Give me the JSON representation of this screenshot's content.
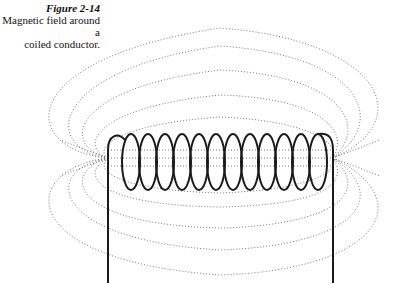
{
  "page": {
    "cut_text": "r ... y ... g ... p ... y"
  },
  "figure": {
    "label": "Figure 2-14",
    "caption_line1": "Magnetic field around a",
    "caption_line2": "coiled conductor.",
    "coil_turns": 13,
    "colors": {
      "wire": "#1a1a1a",
      "field_lines": "#777777",
      "background": "#ffffff"
    }
  }
}
